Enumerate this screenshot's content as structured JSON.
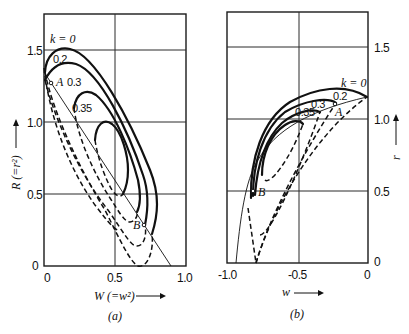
{
  "panel_a": {
    "caption": "(a)",
    "xlabel": "W (=w²)",
    "ylabel": "R (=r²)",
    "xticks": [
      "0",
      "0.5",
      "1.0"
    ],
    "yticks": [
      "0",
      "0.5",
      "1.0",
      "1.5"
    ],
    "k_labels": [
      "k = 0",
      "0.2",
      "0.3",
      "0.35"
    ],
    "points": [
      "A",
      "B"
    ]
  },
  "panel_b": {
    "caption": "(b)",
    "xlabel": "w",
    "ylabel": "r",
    "xticks": [
      "-1.0",
      "-0.5",
      "0"
    ],
    "yticks": [
      "0",
      "0.5",
      "1.0",
      "1.5"
    ],
    "k_labels": [
      "k = 0",
      "0.2",
      "0.3",
      "0.35"
    ],
    "points": [
      "A",
      "B"
    ]
  },
  "arrow_glyph": "⟶"
}
